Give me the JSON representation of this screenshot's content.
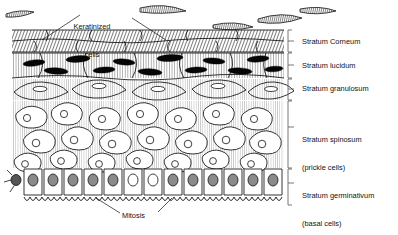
{
  "figure": {
    "type": "histological-diagram",
    "background_color": "#ffffff",
    "ink_color": "#111111"
  },
  "callouts": [
    {
      "id": "keratinized-cells",
      "text": "Keratinized\ncells",
      "line1": "Keratinized",
      "line2": "cells",
      "x": 78,
      "y": 4,
      "leaders": 2
    },
    {
      "id": "mitosis",
      "text": "Mitosis",
      "x": 122,
      "y": 212,
      "leaders": 2
    }
  ],
  "strata": [
    {
      "id": "stratum-corneum",
      "label": "Stratum Corneum",
      "label_x": 302,
      "label_y": 38,
      "bracket_top": 30,
      "bracket_bottom": 52,
      "description": "flattened dead keratinized squames, dense diagonal hatching"
    },
    {
      "id": "stratum-lucidum",
      "label": "Stratum lucidum",
      "label_x": 302,
      "label_y": 62,
      "bracket_top": 53,
      "bracket_bottom": 78,
      "description": "cells with dark lens-shaped nuclei"
    },
    {
      "id": "stratum-granulosum",
      "label": "Stratum granulosum",
      "label_x": 302,
      "label_y": 84,
      "bracket_top": 79,
      "bracket_bottom": 100,
      "description": "wide flattened polygonal cells with small oval nuclei"
    },
    {
      "id": "stratum-spinosum",
      "label": "Stratum spinosum",
      "sub_label": "(prickle cells)",
      "label_x": 302,
      "label_y": 122,
      "bracket_top": 101,
      "bracket_bottom": 168,
      "description": "rounded irregular cells with round nuclei and spiny intercellular bridges"
    },
    {
      "id": "stratum-germinativum",
      "label": "Stratum germinativum",
      "sub_label": "(basal cells)",
      "label_x": 302,
      "label_y": 178,
      "bracket_top": 169,
      "bracket_bottom": 205,
      "description": "single row of tall columnar basal cells with stippled nuclei on a wavy basement membrane"
    }
  ],
  "features": {
    "shed_flakes_count": 5,
    "melanocyte_present": true,
    "basement_membrane": "wavy scalloped line"
  }
}
